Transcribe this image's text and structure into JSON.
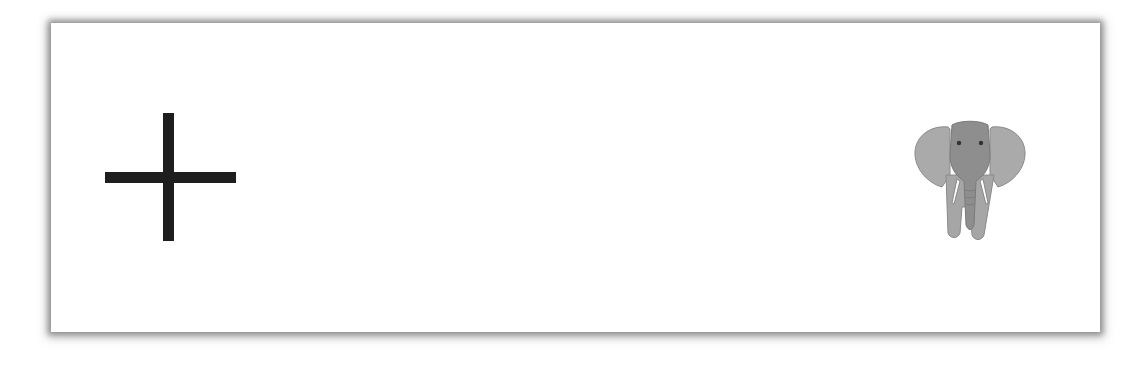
{
  "stimulus": {
    "left_symbol": {
      "type": "fixation-cross",
      "color": "#1e1e1e"
    },
    "right_image": {
      "type": "elephant",
      "colors": {
        "ears": "#a9a9a9",
        "head": "#8f8f8f",
        "tusks": "#ffffff",
        "body": "#a4a4a4"
      }
    },
    "background": "#ffffff"
  }
}
